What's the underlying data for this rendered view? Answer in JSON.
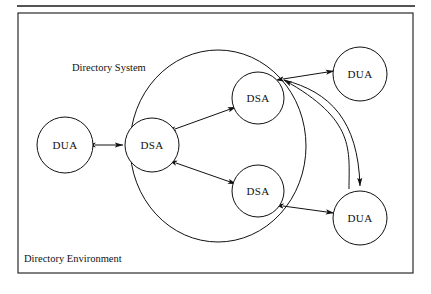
{
  "figure": {
    "type": "diagram",
    "subtype": "node-link-diagram",
    "top_rule": {
      "x1": 17,
      "y1": 6,
      "x2": 415,
      "y2": 6
    },
    "outer_frame": {
      "x": 18,
      "y": 13,
      "width": 395,
      "height": 260
    },
    "region_labels": [
      {
        "id": "directory-system",
        "text": "Directory System",
        "x": 72,
        "y": 71
      },
      {
        "id": "directory-environment",
        "text": "Directory Environment",
        "x": 24,
        "y": 262
      }
    ],
    "boundary": {
      "id": "directory-system-boundary",
      "shape": "ellipse",
      "cx": 218,
      "cy": 146,
      "rx": 88,
      "ry": 96
    },
    "nodes": [
      {
        "id": "dua-left",
        "label": "DUA",
        "cx": 65,
        "cy": 145,
        "r": 28,
        "inside_boundary": false
      },
      {
        "id": "dsa-center",
        "label": "DSA",
        "cx": 152,
        "cy": 145,
        "r": 27,
        "inside_boundary": true
      },
      {
        "id": "dsa-top",
        "label": "DSA",
        "cx": 258,
        "cy": 98,
        "r": 26,
        "inside_boundary": true
      },
      {
        "id": "dsa-bottom",
        "label": "DSA",
        "cx": 258,
        "cy": 191,
        "r": 26,
        "inside_boundary": true
      },
      {
        "id": "dua-top-right",
        "label": "DUA",
        "cx": 360,
        "cy": 74,
        "r": 27,
        "inside_boundary": false
      },
      {
        "id": "dua-bottom-right",
        "label": "DUA",
        "cx": 360,
        "cy": 218,
        "r": 27,
        "inside_boundary": false
      }
    ],
    "edges": [
      {
        "id": "edge-dua-left-dsa-center",
        "from": "dua-left",
        "to": "dsa-center",
        "arrows": "both",
        "shape": "straight"
      },
      {
        "id": "edge-dsa-center-dsa-top",
        "from": "dsa-center",
        "to": "dsa-top",
        "arrows": "both",
        "shape": "straight"
      },
      {
        "id": "edge-dsa-center-dsa-bottom",
        "from": "dsa-center",
        "to": "dsa-bottom",
        "arrows": "both",
        "shape": "straight"
      },
      {
        "id": "edge-dsa-top-dua-top-right",
        "from": "dsa-top",
        "to": "dua-top-right",
        "arrows": "both",
        "shape": "straight"
      },
      {
        "id": "edge-dsa-bottom-dua-bot-right",
        "from": "dsa-bottom",
        "to": "dua-bottom-right",
        "arrows": "both",
        "shape": "straight"
      },
      {
        "id": "edge-dsa-top-dua-bot-right",
        "from": "dsa-top",
        "to": "dua-bottom-right",
        "arrows": "to-target",
        "shape": "curved"
      },
      {
        "id": "edge-dua-top-right-dsa-top",
        "from": "dua-top-right",
        "to": "dsa-top",
        "arrows": "to-target",
        "shape": "curved"
      }
    ],
    "colors": {
      "stroke": "#111111",
      "frame": "#2a2a2a",
      "background": "#ffffff"
    }
  }
}
